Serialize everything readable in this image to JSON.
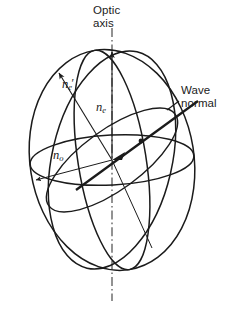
{
  "figure": {
    "kind": "optical-indicatrix-diagram",
    "title_visible": false,
    "background_color": "#ffffff",
    "line_color": "#1b1b1b",
    "width_px": 236,
    "height_px": 312
  },
  "labels": {
    "optic_axis": "Optic\naxis",
    "wave_normal": "Wave\nnormal",
    "n_e_prime_base": "n",
    "n_e_prime_sub": "e",
    "n_e_prime_mark": "′",
    "n_e_base": "n",
    "n_e_sub": "e",
    "n_o_base": "n",
    "n_o_sub": "o"
  },
  "geometry": {
    "center": {
      "x": 112,
      "y": 160
    },
    "outer_ellipse": {
      "cx": 112,
      "cy": 160,
      "rx": 84,
      "ry": 112,
      "rotation_deg": -10
    },
    "equatorial_ellipse": {
      "cx": 112,
      "cy": 160,
      "rx": 84,
      "ry": 26,
      "rotation_deg": -3
    },
    "meridian_front": {
      "cx": 112,
      "cy": 160,
      "rx": 36,
      "ry": 112,
      "rotation_deg": -10
    },
    "meridian_tilted": {
      "cx": 112,
      "cy": 160,
      "rx": 62,
      "ry": 112,
      "rotation_deg": 14
    },
    "optic_axis_line": {
      "x1": 112,
      "y1": 28,
      "x2": 112,
      "y2": 300,
      "style": "dash-dot"
    },
    "n_e_arrow": {
      "x1": 112,
      "y1": 160,
      "x2": 112,
      "y2": 50
    },
    "n_e_prime_arrow": {
      "x1": 112,
      "y1": 160,
      "x2": 58,
      "y2": 70
    },
    "n_o_arrow": {
      "x1": 112,
      "y1": 160,
      "x2": 32,
      "y2": 180
    },
    "wave_normal_line": {
      "x1": 78,
      "y1": 188,
      "x2": 196,
      "y2": 102
    },
    "wave_normal_leader": {
      "x1": 178,
      "y1": 104,
      "x2": 163,
      "y2": 116
    },
    "wave_normal_dot": {
      "x": 140,
      "y": 141,
      "r": 2.4
    }
  }
}
